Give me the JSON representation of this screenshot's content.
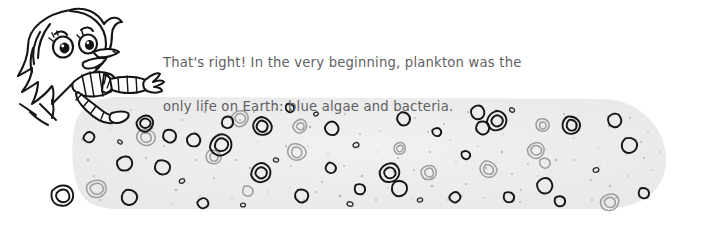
{
  "page": {
    "background_color": "#ffffff",
    "width": 701,
    "height": 229
  },
  "narration": {
    "speaker": "feathery-cartoon-character",
    "text_color": "#5f5f63",
    "line_1": "That's right! In the very beginning, plankton was the",
    "line_2": "only life on Earth: blue algae and bacteria.",
    "full_text": "That's right! In the very beginning, plankton was the only life on Earth: blue algae and bacteria."
  },
  "character": {
    "name": "running-plankton-guide-character",
    "outline_color": "#1b1b1b",
    "fill_color": "#ffffff",
    "parts": [
      "feathery-hair",
      "round-head",
      "left-eye",
      "right-eye",
      "eyebrow-left",
      "eyebrow-right",
      "open-beak-mouth",
      "striped-scarf",
      "striped-arm",
      "hand",
      "striped-leg",
      "foot",
      "motion-lines"
    ]
  },
  "soup_band": {
    "name": "primordial-soup-band",
    "fill_color": "#ededed",
    "speckle_color": "#bdbdbd",
    "left_edge_x": 72,
    "right_edge_x": 668,
    "top_edge_y": 96,
    "bottom_edge_y": 208,
    "description": "Light grey horizontal band of primordial ocean filled with plankton cells"
  },
  "cells": {
    "name": "plankton-cells",
    "dark_outline_color": "#1b1b1b",
    "light_outline_color": "#9a9a9a",
    "shape": "kidney-bean-double-outline",
    "dark_count": 27,
    "light_count": 14,
    "speck_count": 120,
    "legend": [
      "blue algae",
      "bacteria"
    ]
  }
}
